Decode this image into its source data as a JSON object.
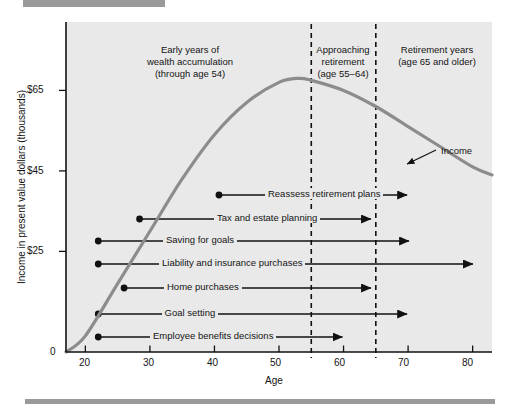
{
  "figure": {
    "bars": {
      "top_bar": "decorative-rule",
      "bottom_bar": "decorative-rule"
    }
  },
  "chart_data": {
    "type": "line",
    "title": "",
    "xlabel": "Age",
    "ylabel": "Income in present value dollars (thousands)",
    "xlim": [
      17,
      83
    ],
    "ylim": [
      0,
      82
    ],
    "xticks": [
      20,
      30,
      40,
      50,
      60,
      70,
      80
    ],
    "xticklabels": [
      "20",
      "30",
      "40",
      "50",
      "60",
      "70",
      "80"
    ],
    "yticks": [
      0,
      25,
      45,
      65
    ],
    "yticklabels": [
      "0",
      "$25",
      "$45",
      "$65"
    ],
    "grid": false,
    "legend": false,
    "series": [
      {
        "name": "Income",
        "annotation": "Income",
        "color": "#8c8c8c",
        "points": [
          {
            "age": 17,
            "income": 0
          },
          {
            "age": 20,
            "income": 4
          },
          {
            "age": 25,
            "income": 17
          },
          {
            "age": 30,
            "income": 30
          },
          {
            "age": 35,
            "income": 43
          },
          {
            "age": 40,
            "income": 54
          },
          {
            "age": 45,
            "income": 62
          },
          {
            "age": 50,
            "income": 67
          },
          {
            "age": 53,
            "income": 68
          },
          {
            "age": 55,
            "income": 67.5
          },
          {
            "age": 60,
            "income": 65
          },
          {
            "age": 65,
            "income": 61
          },
          {
            "age": 70,
            "income": 56
          },
          {
            "age": 75,
            "income": 51
          },
          {
            "age": 80,
            "income": 46
          },
          {
            "age": 83,
            "income": 44
          }
        ]
      }
    ],
    "vlines": [
      {
        "age": 55,
        "style": "dashed"
      },
      {
        "age": 65,
        "style": "dashed"
      }
    ],
    "zones": [
      {
        "id": "early",
        "text": "Early years of\nwealth accumulation\n(through age 54)",
        "line1": "Early years of",
        "line2": "wealth accumulation",
        "line3": "(through age 54)",
        "center_age": 37
      },
      {
        "id": "approaching",
        "text": "Approaching\nretirement\n(age 55–64)",
        "line1": "Approaching",
        "line2": "retirement",
        "line3": "(age 55–64)",
        "center_age": 60
      },
      {
        "id": "retirement",
        "text": "Retirement years\n(age 65 and older)",
        "line1": "Retirement years",
        "line2": "(age 65 and older)",
        "center_age": 74
      }
    ],
    "tasks": [
      {
        "label": "Reassess retirement plans",
        "start_age": 40.7,
        "end_age": 70.0,
        "row_y": 195
      },
      {
        "label": "Tax and estate planning",
        "start_age": 28.4,
        "end_age": 64.4,
        "row_y": 219
      },
      {
        "label": "Saving for goals",
        "start_age": 22.0,
        "end_age": 70.3,
        "row_y": 241
      },
      {
        "label": "Liability and insurance purchases",
        "start_age": 22.0,
        "end_age": 80.2,
        "row_y": 264
      },
      {
        "label": "Home purchases",
        "start_age": 26.0,
        "end_age": 64.4,
        "row_y": 288
      },
      {
        "label": "Goal setting",
        "start_age": 22.0,
        "end_age": 70.0,
        "row_y": 314
      },
      {
        "label": "Employee benefits decisions",
        "start_age": 22.0,
        "end_age": 60.0,
        "row_y": 337
      }
    ]
  },
  "colors": {
    "plot_background": "#e9e9e9",
    "curve": "#8c8c8c",
    "axis": "#111111",
    "task_line": "#111111",
    "rule": "#9a9a9a"
  }
}
